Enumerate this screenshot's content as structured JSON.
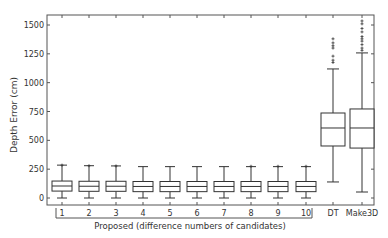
{
  "chart_data": {
    "type": "box",
    "title": "",
    "xlabel": "Proposed (difference numbers of candidates)",
    "ylabel": "Depth Error (cm)",
    "ylim": [
      -60,
      1570
    ],
    "yticks": [
      0,
      250,
      500,
      750,
      1000,
      1250,
      1500
    ],
    "grid": false,
    "categories": [
      "1",
      "2",
      "3",
      "4",
      "5",
      "6",
      "7",
      "8",
      "9",
      "10",
      "DT",
      "Make3D"
    ],
    "group_bracket": {
      "label": "Proposed (difference numbers of candidates)",
      "from": "1",
      "to": "10"
    },
    "boxes": [
      {
        "label": "1",
        "whislo": 0,
        "q1": 60,
        "median": 104,
        "q3": 147,
        "whishi": 285,
        "outliers": [
          285
        ]
      },
      {
        "label": "2",
        "whislo": 0,
        "q1": 58,
        "median": 102,
        "q3": 145,
        "whishi": 280,
        "outliers": [
          280
        ]
      },
      {
        "label": "3",
        "whislo": 0,
        "q1": 58,
        "median": 102,
        "q3": 145,
        "whishi": 278,
        "outliers": [
          278
        ]
      },
      {
        "label": "4",
        "whislo": 0,
        "q1": 55,
        "median": 100,
        "q3": 143,
        "whishi": 272,
        "outliers": []
      },
      {
        "label": "5",
        "whislo": 0,
        "q1": 55,
        "median": 100,
        "q3": 143,
        "whishi": 272,
        "outliers": []
      },
      {
        "label": "6",
        "whislo": 0,
        "q1": 55,
        "median": 100,
        "q3": 143,
        "whishi": 272,
        "outliers": []
      },
      {
        "label": "7",
        "whislo": 0,
        "q1": 55,
        "median": 100,
        "q3": 143,
        "whishi": 272,
        "outliers": []
      },
      {
        "label": "8",
        "whislo": 0,
        "q1": 55,
        "median": 100,
        "q3": 143,
        "whishi": 272,
        "outliers": [
          275
        ]
      },
      {
        "label": "9",
        "whislo": 0,
        "q1": 55,
        "median": 100,
        "q3": 143,
        "whishi": 272,
        "outliers": [
          275
        ]
      },
      {
        "label": "10",
        "whislo": 0,
        "q1": 55,
        "median": 100,
        "q3": 143,
        "whishi": 272,
        "outliers": [
          275
        ]
      },
      {
        "label": "DT",
        "whislo": 139,
        "q1": 451,
        "median": 607,
        "q3": 737,
        "whishi": 1119,
        "outliers": [
          1175,
          1195,
          1230,
          1300,
          1320,
          1345,
          1380
        ]
      },
      {
        "label": "Make3D",
        "whislo": 52,
        "q1": 433,
        "median": 607,
        "q3": 772,
        "whishi": 1258,
        "outliers": [
          1280,
          1300,
          1330,
          1360,
          1380,
          1400,
          1440,
          1470,
          1510,
          1535
        ]
      }
    ]
  },
  "axes": {
    "ytick_labels": [
      "0",
      "250",
      "500",
      "750",
      "1000",
      "1250",
      "1500"
    ],
    "xtick_labels": [
      "1",
      "2",
      "3",
      "4",
      "5",
      "6",
      "7",
      "8",
      "9",
      "10",
      "DT",
      "Make3D"
    ]
  },
  "colors": {
    "line": "#333333",
    "frame": "#555555",
    "text": "#333333"
  }
}
